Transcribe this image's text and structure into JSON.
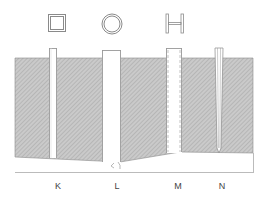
{
  "diagram": {
    "type": "cross-section",
    "colors": {
      "ground_fill": "#c8c8c8",
      "hatch": "#a8a8a8",
      "outline": "#8a8a8a",
      "label": "#444444"
    },
    "profiles": [
      {
        "id": "K",
        "shape": "square"
      },
      {
        "id": "L",
        "shape": "circle"
      },
      {
        "id": "M",
        "shape": "h-beam"
      },
      {
        "id": "N",
        "shape": "tapered"
      }
    ],
    "labels": [
      "K",
      "L",
      "M",
      "N"
    ]
  }
}
